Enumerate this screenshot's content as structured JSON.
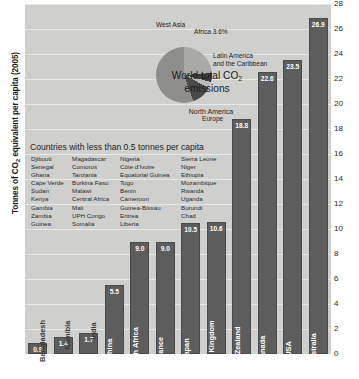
{
  "axis": {
    "y_title_main": "Tonnes of CO",
    "y_title_sub": "2",
    "y_title_tail": " equivalent per capita (2005)",
    "ticks": [
      "28",
      "26",
      "24",
      "22",
      "20",
      "18",
      "16",
      "14",
      "12",
      "10",
      "8",
      "6",
      "4",
      "2",
      "0"
    ]
  },
  "pie": {
    "title_main": "World total CO",
    "title_sub": "2",
    "title_tail": "emissions",
    "labels": {
      "north_america": "North America",
      "west_asia": "West Asia",
      "africa": "Africa 3.6%",
      "latin_america_line1": "Latin America",
      "latin_america_line2": "and the Caribbean",
      "europe": "Europe"
    }
  },
  "list": {
    "title": "Countries with less than 0.5 tonnes per capita",
    "columns": [
      [
        "Djibouti",
        "Senegal",
        "Ghana",
        "Cape Verde",
        "Sudan",
        "Kenya",
        "Gambia",
        "Zambia",
        "Guinea"
      ],
      [
        "Magadascar",
        "Comoros",
        "Tanzania",
        "Burkina Faso",
        "Malawi",
        "Central Africa",
        "Mali",
        "UPH Congo",
        "Somalia"
      ],
      [
        "Nigeria",
        "Côte d'Ivoire",
        "Equatorial Guinea",
        "Togo",
        "Benin",
        "Cameroon",
        "Guinea-Bissau",
        "Eritrea",
        "Liberia"
      ],
      [
        "Sierra Leone",
        "Niger",
        "Ethiopia",
        "Mozambique",
        "Rwanda",
        "Uganda",
        "Burundi",
        "Chad"
      ]
    ]
  },
  "chart_data": {
    "type": "bar",
    "title": "",
    "xlabel": "",
    "ylabel": "Tonnes of CO2 equivalent per capita (2005)",
    "ylim": [
      0,
      28
    ],
    "grid": true,
    "legend": "none",
    "categories": [
      "Bangladesh",
      "Namibia",
      "India",
      "China",
      "South Africa",
      "France",
      "Japan",
      "United Kingdom",
      "New Zealand",
      "Canada",
      "USA",
      "Australia"
    ],
    "values": [
      0.9,
      1.4,
      1.7,
      5.5,
      9.0,
      9.0,
      10.5,
      10.6,
      18.8,
      22.6,
      23.5,
      26.9
    ],
    "value_labels": [
      "0.9",
      "1.4",
      "1.7",
      "5.5",
      "9.0",
      "9.0",
      "10.5",
      "10.6",
      "18.8",
      "22.6",
      "23.5",
      "26.9"
    ],
    "bar_color": "#5d5d5d",
    "plot_background": "#cfcfcd"
  },
  "pie_data": {
    "type": "pie",
    "title": "World total CO2 emissions",
    "slices": [
      {
        "label": "North America",
        "percent": 24.0,
        "color": "#a9a9a7"
      },
      {
        "label": "West Asia",
        "percent": 5.0,
        "color": "#3c3c3c"
      },
      {
        "label": "Africa",
        "percent": 3.6,
        "color": "#b8b8b6",
        "value_label": "3.6%"
      },
      {
        "label": "Latin America and the Caribbean",
        "percent": 12.0,
        "color": "#4a4a4a"
      },
      {
        "label": "Europe",
        "percent": 55.4,
        "color": "#8e8e8c"
      }
    ]
  }
}
